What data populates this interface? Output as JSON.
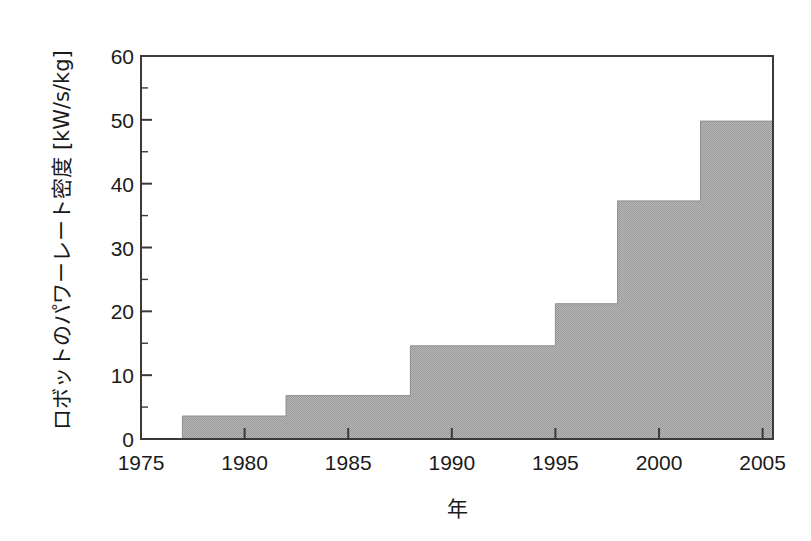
{
  "chart_data": {
    "type": "area",
    "subtype": "step-area",
    "title": "",
    "xlabel": "年",
    "ylabel": "ロボットのパワーレート密度 [kW/s/kg]",
    "xlim": [
      1975,
      2005.5
    ],
    "ylim": [
      0,
      60
    ],
    "xticks": [
      1975,
      1980,
      1985,
      1990,
      1995,
      2000,
      2005
    ],
    "xtick_labels": [
      "1975",
      "1980",
      "1985",
      "1990",
      "1995",
      "2000",
      "2005"
    ],
    "yticks": [
      0,
      10,
      20,
      30,
      40,
      50,
      60
    ],
    "ytick_labels": [
      "0",
      "10",
      "20",
      "30",
      "40",
      "50",
      "60"
    ],
    "minor_ytick_step": 5,
    "grid": false,
    "legend": null,
    "fill_color": "#a9a9a9",
    "line_color": "#3a3a3a",
    "background": "#ffffff",
    "x": [
      1977,
      1982,
      1988,
      1995,
      1998,
      2002,
      2005.5
    ],
    "values": [
      3.6,
      6.8,
      14.6,
      21.2,
      37.3,
      49.8,
      49.8
    ],
    "steps": [
      {
        "year_start": 1977,
        "year_end": 1982,
        "value": 3.6
      },
      {
        "year_start": 1982,
        "year_end": 1988,
        "value": 6.8
      },
      {
        "year_start": 1988,
        "year_end": 1995,
        "value": 14.6
      },
      {
        "year_start": 1995,
        "year_end": 1998,
        "value": 21.2
      },
      {
        "year_start": 1998,
        "year_end": 2002,
        "value": 37.3
      },
      {
        "year_start": 2002,
        "year_end": 2005.5,
        "value": 49.8
      }
    ]
  }
}
